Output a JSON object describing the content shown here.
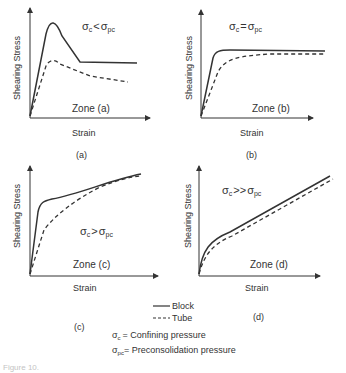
{
  "panels": [
    {
      "id": "a",
      "caption": "(a)",
      "ylabel": "Shearing  Stress",
      "xlabel": "Strain",
      "zone": "Zone  (a)",
      "condition": {
        "left": "σ",
        "lsub": "c",
        "op": "<",
        "right": "σ",
        "rsub": "pc"
      }
    },
    {
      "id": "b",
      "caption": "(b)",
      "ylabel": "Shearing  Stress",
      "xlabel": "Strain",
      "zone": "Zone  (b)",
      "condition": {
        "left": "σ",
        "lsub": "c",
        "op": "=",
        "right": "σ",
        "rsub": "pc"
      }
    },
    {
      "id": "c",
      "caption": "(c)",
      "ylabel": "Shearing  Stress",
      "xlabel": "Strain",
      "zone": "Zone  (c)",
      "condition": {
        "left": "σ",
        "lsub": "c",
        "op": ">",
        "right": "σ",
        "rsub": "pc"
      }
    },
    {
      "id": "d",
      "caption": "(d)",
      "ylabel": "Shearing  Stress",
      "xlabel": "Strain",
      "zone": "Zone   (d)",
      "condition": {
        "left": "σ",
        "lsub": "c",
        "op": ">>",
        "right": "σ",
        "rsub": "pc"
      }
    }
  ],
  "legend": {
    "block": "Block",
    "tube": "Tube",
    "def1_sym": "σ",
    "def1_sub": "c",
    "def1_text": "=  Confining   pressure",
    "def2_sym": "σ",
    "def2_sub": "pc",
    "def2_text": "= Preconsolidation   pressure"
  },
  "figure_caption": "Figure 10."
}
